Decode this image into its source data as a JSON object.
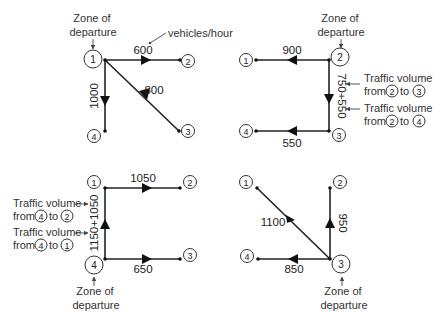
{
  "annotations": {
    "zone_of_departure_line1": "Zone of",
    "zone_of_departure_line2": "departure",
    "unit_label": "vehicles/hour",
    "traffic_volume": "Traffic volume",
    "from": "from",
    "to": "to"
  },
  "panels": [
    {
      "id": "panel-1",
      "departure_zone": "1",
      "nodes": [
        "1",
        "2",
        "3",
        "4"
      ],
      "edges": [
        {
          "from": "1",
          "to": "2",
          "volume": "600"
        },
        {
          "from": "1",
          "to": "3",
          "volume": "800"
        },
        {
          "from": "1",
          "to": "4",
          "volume": "1000"
        }
      ]
    },
    {
      "id": "panel-2",
      "departure_zone": "2",
      "nodes": [
        "1",
        "2",
        "3",
        "4"
      ],
      "edges": [
        {
          "from": "2",
          "to": "1",
          "volume": "900"
        },
        {
          "from": "2",
          "to": "3",
          "volume": "750+550"
        },
        {
          "from": "3",
          "to": "4",
          "volume": "550"
        }
      ],
      "callouts": [
        {
          "from": "2",
          "to": "3"
        },
        {
          "from": "2",
          "to": "4"
        }
      ]
    },
    {
      "id": "panel-3",
      "departure_zone": "4",
      "nodes": [
        "1",
        "2",
        "3",
        "4"
      ],
      "edges": [
        {
          "from": "1",
          "to": "2",
          "volume": "1050"
        },
        {
          "from": "4",
          "to": "1",
          "volume": "1150+1050"
        },
        {
          "from": "4",
          "to": "3",
          "volume": "650"
        }
      ],
      "callouts": [
        {
          "from": "4",
          "to": "2"
        },
        {
          "from": "4",
          "to": "1"
        }
      ]
    },
    {
      "id": "panel-4",
      "departure_zone": "3",
      "nodes": [
        "1",
        "2",
        "3",
        "4"
      ],
      "edges": [
        {
          "from": "3",
          "to": "1",
          "volume": "1100"
        },
        {
          "from": "3",
          "to": "2",
          "volume": "950"
        },
        {
          "from": "3",
          "to": "4",
          "volume": "850"
        }
      ]
    }
  ]
}
